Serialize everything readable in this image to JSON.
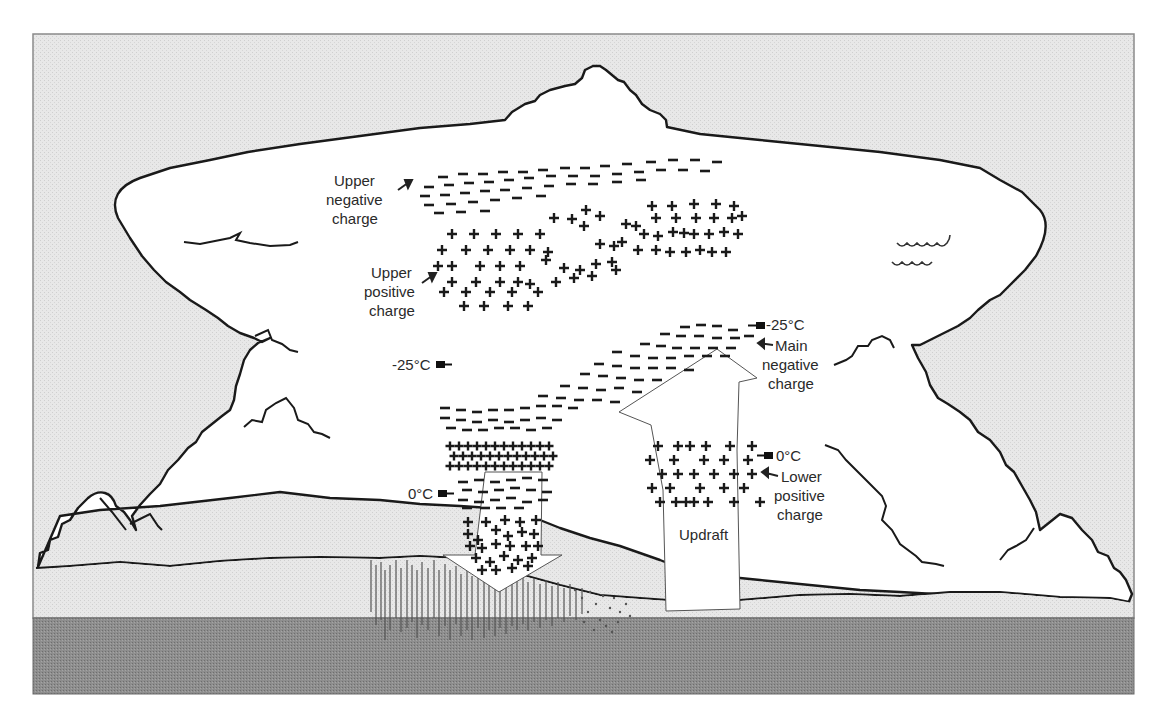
{
  "diagram": {
    "colors": {
      "sky": "#e6e6e6",
      "ground": "#8c8c8c",
      "lower_sky": "#e9e9e9",
      "cloud": "#ffffff",
      "outline": "#1a1a1a"
    },
    "labels": {
      "upper_negative": [
        "Upper",
        "negative",
        "charge"
      ],
      "upper_positive": [
        "Upper",
        "positive",
        "charge"
      ],
      "main_negative": [
        "Main",
        "negative",
        "charge"
      ],
      "lower_positive": [
        "Lower",
        "positive",
        "charge"
      ],
      "updraft": "Updraft",
      "temp_left_upper": "-25°C",
      "temp_left_lower": "0°C",
      "temp_right_upper": "-25°C",
      "temp_right_lower": "0°C"
    },
    "charge_symbols": {
      "negative": "−",
      "positive": "+"
    }
  }
}
